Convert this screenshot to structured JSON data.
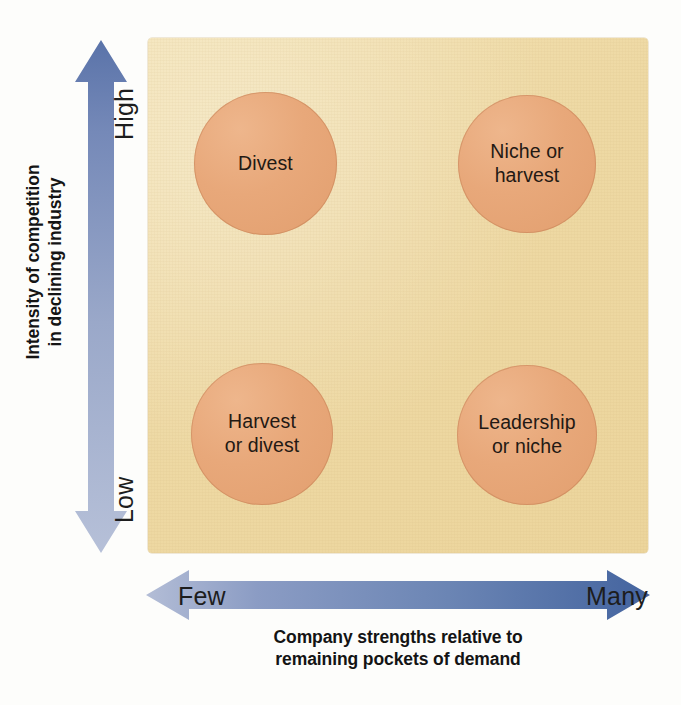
{
  "figure": {
    "type": "strategy-matrix"
  },
  "panel": {
    "background_color": "#eed9a4",
    "bubble_color": "#e8a87a"
  },
  "y_axis": {
    "title_line1": "Intensity of competition",
    "title_line2": "in declining industry",
    "high_label": "High",
    "low_label": "Low",
    "arrow_color_top": "#5d76ab",
    "arrow_color_bottom": "#aeb9d4",
    "direction": "double-headed-vertical"
  },
  "x_axis": {
    "title_line1": "Company strengths relative to",
    "title_line2": "remaining pockets of demand",
    "low_label": "Few",
    "high_label": "Many",
    "arrow_color_left": "#aeb9d4",
    "arrow_color_right": "#4a69a4",
    "direction": "double-headed-horizontal"
  },
  "quadrants": [
    {
      "id": "top-left",
      "label_line1": "Divest",
      "label_line2": ""
    },
    {
      "id": "top-right",
      "label_line1": "Niche or",
      "label_line2": "harvest"
    },
    {
      "id": "bottom-left",
      "label_line1": "Harvest",
      "label_line2": "or divest"
    },
    {
      "id": "bottom-right",
      "label_line1": "Leadership",
      "label_line2": "or niche"
    }
  ]
}
